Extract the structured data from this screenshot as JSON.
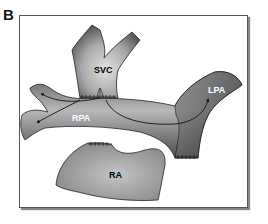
{
  "panel": {
    "letter": "B"
  },
  "diagram": {
    "labels": {
      "svc": "SVC",
      "rpa": "RPA",
      "lpa": "LPA",
      "ra": "RA"
    },
    "colors": {
      "vessel_dark": "#4a4a4a",
      "vessel_light": "#bdbdbd",
      "ra_fill": "#9a9a9a",
      "outline": "#222222",
      "label_dark": "#000000",
      "label_light": "#ffffff"
    }
  }
}
